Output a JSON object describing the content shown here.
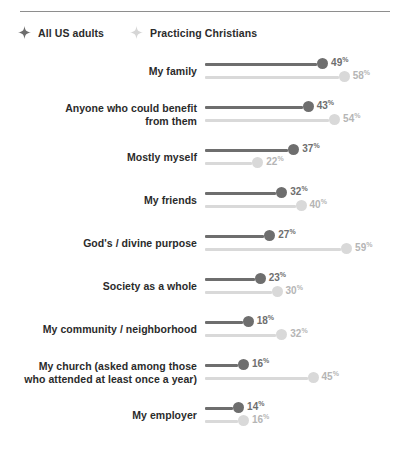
{
  "legend": {
    "items": [
      {
        "label": "All US adults",
        "marker": "four-point-star-icon",
        "color": "#6e6e6e"
      },
      {
        "label": "Practicing Christians",
        "marker": "four-point-star-icon",
        "color": "#d6d6d6"
      }
    ]
  },
  "colors": {
    "primary": "#6e6e6e",
    "secondary": "#d9d9d9",
    "primary_value_text": "#6e6e6e",
    "secondary_value_text": "#b5b5b5",
    "label_text": "#2b2b2b",
    "rule": "#8e8e8e",
    "background": "#ffffff"
  },
  "chart_data": {
    "type": "bar",
    "subtype": "lollipop-dot-plot",
    "title": "",
    "subtitle": "",
    "xlabel": "",
    "ylabel": "",
    "xlim": [
      0,
      60
    ],
    "grid": false,
    "legend_position": "top-left",
    "value_suffix": "%",
    "categories": [
      "My family",
      "Anyone who could benefit from them",
      "Mostly myself",
      "My friends",
      "God's / divine purpose",
      "Society as a whole",
      "My community / neighborhood",
      "My church (asked among those who attended at least once a year)",
      "My employer"
    ],
    "category_lines": [
      [
        "My family"
      ],
      [
        "Anyone who could benefit",
        "from them"
      ],
      [
        "Mostly myself"
      ],
      [
        "My friends"
      ],
      [
        "God's / divine purpose"
      ],
      [
        "Society as a whole"
      ],
      [
        "My community / neighborhood"
      ],
      [
        "My church (asked among those",
        "who attended at least once a year)"
      ],
      [
        "My employer"
      ]
    ],
    "series": [
      {
        "name": "All US adults",
        "values": [
          49,
          43,
          37,
          32,
          27,
          23,
          18,
          16,
          14
        ],
        "labels": [
          "49%",
          "43%",
          "37%",
          "32%",
          "27%",
          "23%",
          "18%",
          "16%",
          "14%"
        ]
      },
      {
        "name": "Practicing Christians",
        "values": [
          58,
          54,
          22,
          40,
          59,
          30,
          32,
          45,
          16
        ],
        "labels": [
          "58%",
          "54%",
          "22%",
          "40%",
          "59%",
          "30%",
          "32%",
          "45%",
          "16%"
        ]
      }
    ]
  }
}
